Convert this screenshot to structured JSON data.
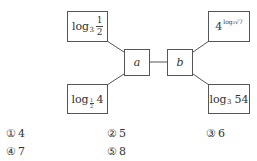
{
  "diagram": {
    "top_left": {
      "base_text": "log",
      "base": "3",
      "arg_num": "1",
      "arg_den": "2"
    },
    "bottom_left": {
      "base_text": "log",
      "base_num": "1",
      "base_den": "2",
      "arg": "4"
    },
    "top_right": {
      "base": "4",
      "exponent": "log₂√7"
    },
    "bottom_right": {
      "base_text": "log",
      "base": "3",
      "arg": "54"
    },
    "node_a": "a",
    "node_b": "b",
    "line_color": "#555555"
  },
  "choices": [
    {
      "marker": "①",
      "value": "4"
    },
    {
      "marker": "②",
      "value": "5"
    },
    {
      "marker": "③",
      "value": "6"
    },
    {
      "marker": "④",
      "value": "7"
    },
    {
      "marker": "⑤",
      "value": "8"
    }
  ]
}
